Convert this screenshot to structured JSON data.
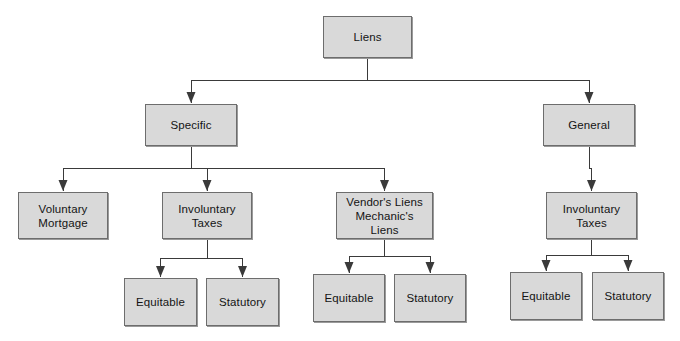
{
  "diagram": {
    "style": {
      "node_fill": "#d9d9d9",
      "node_border": "#6d6d6d",
      "edge_color": "#3a3a3a",
      "text_color": "#141414",
      "background": "#ffffff"
    },
    "nodes": [
      {
        "id": "liens",
        "label": "Liens",
        "x": 323,
        "y": 16,
        "w": 89,
        "h": 42
      },
      {
        "id": "specific",
        "label": "Specific",
        "x": 145,
        "y": 104,
        "w": 92,
        "h": 42
      },
      {
        "id": "general",
        "label": "General",
        "x": 543,
        "y": 104,
        "w": 92,
        "h": 42
      },
      {
        "id": "voluntary-mortgage",
        "label": "Voluntary\nMortgage",
        "x": 18,
        "y": 192,
        "w": 90,
        "h": 47
      },
      {
        "id": "spec-involuntary-taxes",
        "label": "Involuntary\nTaxes",
        "x": 162,
        "y": 192,
        "w": 90,
        "h": 47
      },
      {
        "id": "vendor-mechanic-liens",
        "label": "Vendor's Liens\nMechanic's Liens",
        "x": 336,
        "y": 192,
        "w": 97,
        "h": 47
      },
      {
        "id": "gen-involuntary-taxes",
        "label": "Involuntary\nTaxes",
        "x": 546,
        "y": 192,
        "w": 91,
        "h": 47
      },
      {
        "id": "spec-tax-equitable",
        "label": "Equitable",
        "x": 124,
        "y": 278,
        "w": 73,
        "h": 48
      },
      {
        "id": "spec-tax-statutory",
        "label": "Statutory",
        "x": 206,
        "y": 278,
        "w": 73,
        "h": 48
      },
      {
        "id": "vendor-equitable",
        "label": "Equitable",
        "x": 313,
        "y": 274,
        "w": 72,
        "h": 48
      },
      {
        "id": "vendor-statutory",
        "label": "Statutory",
        "x": 394,
        "y": 274,
        "w": 72,
        "h": 48
      },
      {
        "id": "gen-tax-equitable",
        "label": "Equitable",
        "x": 510,
        "y": 272,
        "w": 72,
        "h": 48
      },
      {
        "id": "gen-tax-statutory",
        "label": "Statutory",
        "x": 592,
        "y": 272,
        "w": 72,
        "h": 48
      }
    ],
    "edges": [
      {
        "id": "liens-to-specific",
        "from": "liens",
        "to": "specific"
      },
      {
        "id": "liens-to-general",
        "from": "liens",
        "to": "general"
      },
      {
        "id": "specific-to-voluntary",
        "from": "specific",
        "to": "voluntary-mortgage"
      },
      {
        "id": "specific-to-involuntary",
        "from": "specific",
        "to": "spec-involuntary-taxes"
      },
      {
        "id": "specific-to-vendor",
        "from": "specific",
        "to": "vendor-mechanic-liens"
      },
      {
        "id": "general-to-involuntary",
        "from": "general",
        "to": "gen-involuntary-taxes"
      },
      {
        "id": "spectax-to-equitable",
        "from": "spec-involuntary-taxes",
        "to": "spec-tax-equitable"
      },
      {
        "id": "spectax-to-statutory",
        "from": "spec-involuntary-taxes",
        "to": "spec-tax-statutory"
      },
      {
        "id": "vendor-to-equitable",
        "from": "vendor-mechanic-liens",
        "to": "vendor-equitable"
      },
      {
        "id": "vendor-to-statutory",
        "from": "vendor-mechanic-liens",
        "to": "vendor-statutory"
      },
      {
        "id": "gentax-to-equitable",
        "from": "gen-involuntary-taxes",
        "to": "gen-tax-equitable"
      },
      {
        "id": "gentax-to-statutory",
        "from": "gen-involuntary-taxes",
        "to": "gen-tax-statutory"
      }
    ],
    "connectors": [
      {
        "id": "liens-split",
        "stem_x": 367,
        "stem_top": 58,
        "bar_y": 78,
        "left_x": 190,
        "right_x": 589,
        "drop_to": 99
      },
      {
        "id": "specific-split",
        "stem_x": 191,
        "stem_top": 146,
        "bar_y": 167,
        "left_x": 62,
        "right_x": 384,
        "drop_to": 188,
        "mid_x": 207
      },
      {
        "id": "general-drop",
        "stem_x": 589,
        "stem_top": 146,
        "bar_y": 167,
        "left_x": 589,
        "right_x": 589,
        "drop_to": 188
      },
      {
        "id": "spectax-split",
        "stem_x": 207,
        "stem_top": 239,
        "bar_y": 258,
        "left_x": 160,
        "right_x": 242,
        "drop_to": 274
      },
      {
        "id": "vendor-split",
        "stem_x": 384,
        "stem_top": 239,
        "bar_y": 254,
        "left_x": 349,
        "right_x": 430,
        "drop_to": 270
      },
      {
        "id": "gentax-split",
        "stem_x": 591,
        "stem_top": 239,
        "bar_y": 252,
        "left_x": 546,
        "right_x": 628,
        "drop_to": 268
      }
    ]
  }
}
